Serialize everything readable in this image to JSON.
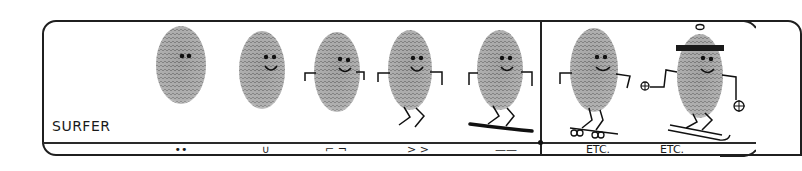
{
  "illustration": {
    "title": "SURFER",
    "figures": [
      {
        "id": "dots",
        "description": "fingerprint with two eye dots"
      },
      {
        "id": "smile",
        "description": "fingerprint with eyes and smile"
      },
      {
        "id": "arms",
        "description": "fingerprint with eyes, smile and bent arms"
      },
      {
        "id": "legs",
        "description": "fingerprint with arms and zig-zag legs"
      },
      {
        "id": "surfboard",
        "description": "fingerprint figure riding a surfboard"
      },
      {
        "id": "skateboard",
        "description": "fingerprint figure on a skateboard"
      },
      {
        "id": "skier",
        "description": "fingerprint figure with hat, ski poles and skis"
      }
    ],
    "legend": [
      {
        "id": "dots",
        "glyph": "••"
      },
      {
        "id": "smile",
        "glyph": "∪"
      },
      {
        "id": "arms",
        "glyph": "⌐ ¬"
      },
      {
        "id": "legs",
        "glyph": "> >"
      },
      {
        "id": "board",
        "glyph": "——"
      },
      {
        "id": "etc1",
        "glyph": "ETC."
      },
      {
        "id": "etc2",
        "glyph": "ETC."
      }
    ],
    "colors": {
      "ink": "#1a1a1a",
      "fingerprint": "#8a8a8a",
      "background": "#ffffff"
    }
  }
}
